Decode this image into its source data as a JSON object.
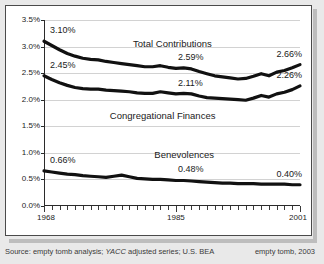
{
  "footer": {
    "source_prefix": "Source: empty tomb analysis; ",
    "source_italic": "YACC",
    "source_suffix": " adjusted series; U.S. BEA",
    "credit": "empty tomb, 2003"
  },
  "chart_data": {
    "type": "line",
    "title": "",
    "xlabel": "",
    "ylabel": "",
    "xlim": [
      1968,
      2001
    ],
    "ylim": [
      0.0,
      3.5
    ],
    "grid": true,
    "legend": "inline-labels",
    "ytick_labels": [
      "3.5%",
      "3.0%",
      "2.5%",
      "2.0%",
      "1.5%",
      "1.0%",
      "0.5%",
      "0.0%"
    ],
    "ytick_values": [
      3.5,
      3.0,
      2.5,
      2.0,
      1.5,
      1.0,
      0.5,
      0.0
    ],
    "xtick_labels": [
      "1968",
      "1985",
      "2001"
    ],
    "xtick_values": [
      1968,
      1985,
      2001
    ],
    "x": [
      1968,
      1969,
      1970,
      1971,
      1972,
      1973,
      1974,
      1975,
      1976,
      1977,
      1978,
      1979,
      1980,
      1981,
      1982,
      1983,
      1984,
      1985,
      1986,
      1987,
      1988,
      1989,
      1990,
      1991,
      1992,
      1993,
      1994,
      1995,
      1996,
      1997,
      1998,
      1999,
      2000,
      2001
    ],
    "series": [
      {
        "name": "Total Contributions",
        "values": [
          3.1,
          3.02,
          2.94,
          2.87,
          2.82,
          2.78,
          2.76,
          2.75,
          2.72,
          2.7,
          2.68,
          2.66,
          2.64,
          2.62,
          2.62,
          2.64,
          2.61,
          2.59,
          2.6,
          2.58,
          2.53,
          2.49,
          2.45,
          2.43,
          2.41,
          2.39,
          2.4,
          2.44,
          2.49,
          2.45,
          2.52,
          2.55,
          2.6,
          2.66
        ],
        "start_label": "3.10%",
        "mid_label": "2.59%",
        "end_label": "2.66%"
      },
      {
        "name": "Congregational Finances",
        "values": [
          2.45,
          2.38,
          2.32,
          2.27,
          2.23,
          2.21,
          2.2,
          2.2,
          2.18,
          2.17,
          2.16,
          2.15,
          2.13,
          2.12,
          2.12,
          2.15,
          2.13,
          2.11,
          2.12,
          2.11,
          2.07,
          2.04,
          2.03,
          2.02,
          2.01,
          2.0,
          1.99,
          2.03,
          2.08,
          2.05,
          2.11,
          2.14,
          2.19,
          2.26
        ],
        "start_label": "2.45%",
        "mid_label": "2.11%",
        "end_label": "2.26%"
      },
      {
        "name": "Benevolences",
        "values": [
          0.66,
          0.64,
          0.62,
          0.6,
          0.59,
          0.57,
          0.56,
          0.55,
          0.54,
          0.56,
          0.58,
          0.55,
          0.52,
          0.51,
          0.5,
          0.5,
          0.49,
          0.48,
          0.48,
          0.47,
          0.46,
          0.45,
          0.44,
          0.43,
          0.43,
          0.42,
          0.42,
          0.42,
          0.41,
          0.41,
          0.41,
          0.41,
          0.4,
          0.4
        ],
        "start_label": "0.66%",
        "mid_label": "0.48%",
        "end_label": "0.40%"
      }
    ]
  }
}
